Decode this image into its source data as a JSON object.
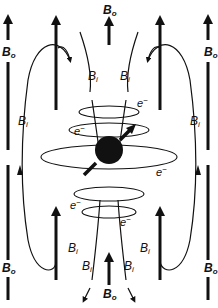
{
  "diagram": {
    "title": "",
    "labels": {
      "outer_field": "B",
      "outer_field_sub": "o",
      "induced_field": "B",
      "induced_field_sub": "i",
      "electron": "e",
      "electron_sup": "−"
    },
    "nodes": [
      {
        "id": "nucleus",
        "label": "nucleus (with spin arrow)"
      },
      {
        "id": "bo-arrows",
        "label": "Bo applied field arrows (upward)",
        "count": 6
      },
      {
        "id": "bi-lines",
        "label": "Bi induced field lines",
        "count": 8
      },
      {
        "id": "electron-loops",
        "label": "electron circulation loops",
        "count": 5
      }
    ],
    "text_instances": {
      "Bo": 7,
      "Bi": 8,
      "e-": 5
    }
  }
}
